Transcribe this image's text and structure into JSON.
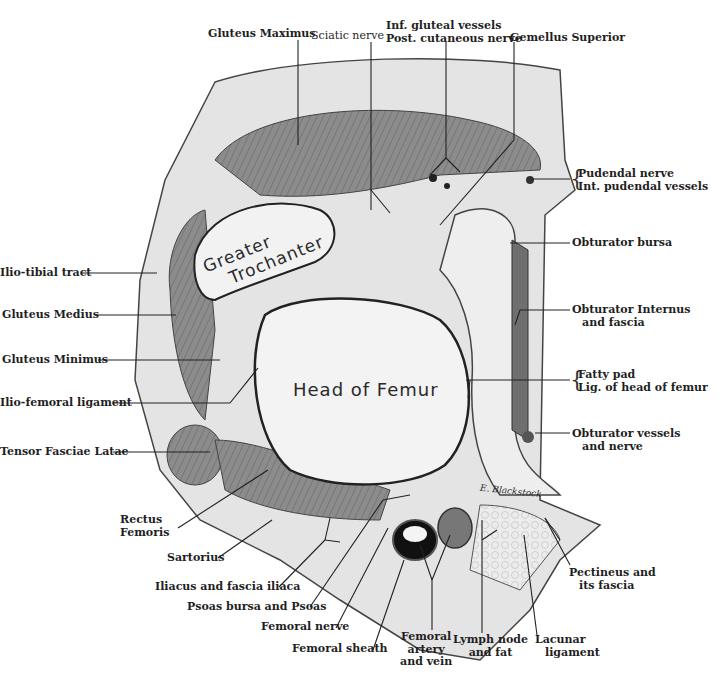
{
  "figure": {
    "type": "anatomical cross-section illustration",
    "signature": "E. Blackstock",
    "inner_labels": {
      "greater_trochanter_line1": "Greater",
      "greater_trochanter_line2": "Trochanter",
      "head_of_femur": "Head of Femur"
    },
    "colors": {
      "background": "#ffffff",
      "skin_fat": "#e6e6e6",
      "muscle": "#8a8a8a",
      "muscle_dark": "#6e6e6e",
      "bone": "#f2f2f2",
      "outline": "#222222",
      "vessel": "#111111"
    }
  },
  "labels": {
    "top": [
      {
        "id": "gluteus-maximus",
        "lines": [
          "Gluteus Maximus"
        ]
      },
      {
        "id": "sciatic-nerve",
        "lines": [
          "Sciatic nerve"
        ]
      },
      {
        "id": "inf-gluteal",
        "lines": [
          "Inf. gluteal vessels",
          "Post. cutaneous nerve"
        ]
      },
      {
        "id": "gemellus-superior",
        "lines": [
          "Gemellus Superior"
        ]
      }
    ],
    "right": [
      {
        "id": "pudendal",
        "lines": [
          "Pudendal nerve",
          "Int. pudendal vessels"
        ]
      },
      {
        "id": "obturator-bursa",
        "lines": [
          "Obturator bursa"
        ]
      },
      {
        "id": "obturator-internus",
        "lines": [
          "Obturator Internus",
          "and fascia"
        ]
      },
      {
        "id": "fatty-pad",
        "lines": [
          "Fatty pad",
          "Lig. of head of femur"
        ]
      },
      {
        "id": "obturator-vessels",
        "lines": [
          "Obturator vessels",
          "and nerve"
        ]
      }
    ],
    "left": [
      {
        "id": "ilio-tibial-tract",
        "lines": [
          "Ilio-tibial tract"
        ]
      },
      {
        "id": "gluteus-medius",
        "lines": [
          "Gluteus Medius"
        ]
      },
      {
        "id": "gluteus-minimus",
        "lines": [
          "Gluteus Minimus"
        ]
      },
      {
        "id": "ilio-femoral-ligament",
        "lines": [
          "Ilio-femoral ligament"
        ]
      },
      {
        "id": "tensor-fasciae-latae",
        "lines": [
          "Tensor Fasciae Latae"
        ]
      }
    ],
    "bottom": [
      {
        "id": "rectus-femoris",
        "lines": [
          "Rectus",
          "Femoris"
        ]
      },
      {
        "id": "sartorius",
        "lines": [
          "Sartorius"
        ]
      },
      {
        "id": "iliacus",
        "lines": [
          "Iliacus and fascia iliaca"
        ]
      },
      {
        "id": "psoas",
        "lines": [
          "Psoas bursa and Psoas"
        ]
      },
      {
        "id": "femoral-nerve",
        "lines": [
          "Femoral nerve"
        ]
      },
      {
        "id": "femoral-sheath",
        "lines": [
          "Femoral sheath"
        ]
      },
      {
        "id": "femoral-artery-vein",
        "lines": [
          "Femoral",
          "artery",
          "and vein"
        ]
      },
      {
        "id": "lymph-node",
        "lines": [
          "Lymph node",
          "and fat"
        ]
      },
      {
        "id": "lacunar-ligament",
        "lines": [
          "Lacunar",
          "ligament"
        ]
      },
      {
        "id": "pectineus",
        "lines": [
          "Pectineus and",
          "its fascia"
        ]
      }
    ]
  }
}
